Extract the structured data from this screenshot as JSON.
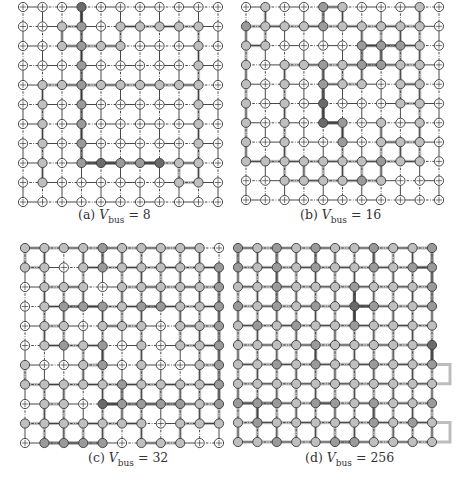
{
  "figure": {
    "grid_size": 11,
    "legend": {
      "0": "empty node (white, crossed)",
      "1": "light gray node",
      "2": "medium gray node",
      "3": "dark node"
    },
    "colors": {
      "edge_thin": "#333333",
      "edge_light": "#bdbdbd",
      "edge_mid": "#8a8a8a",
      "edge_dark": "#5a5a5a",
      "node_empty": "#ffffff",
      "node_light": "#bfbfbf",
      "node_mid": "#9a9a9a",
      "node_dark": "#6a6a6a",
      "node_stroke": "#3a3a3a"
    },
    "panels": [
      {
        "id": "a",
        "label": "(a)",
        "var": "V",
        "sub": "bus",
        "value": "= 8",
        "origin": [
          23,
          7
        ],
        "spacing": [
          19.5,
          19.5
        ],
        "caption_pos": [
          78,
          207
        ],
        "nodes": [
          [
            0,
            0,
            0,
            3,
            0,
            0,
            0,
            0,
            0,
            0,
            0
          ],
          [
            0,
            0,
            1,
            2,
            0,
            1,
            1,
            1,
            1,
            1,
            0
          ],
          [
            0,
            0,
            1,
            2,
            1,
            1,
            0,
            0,
            0,
            1,
            0
          ],
          [
            0,
            0,
            0,
            2,
            0,
            0,
            0,
            0,
            0,
            1,
            0
          ],
          [
            0,
            1,
            1,
            2,
            1,
            1,
            1,
            1,
            1,
            1,
            0
          ],
          [
            0,
            1,
            0,
            2,
            0,
            0,
            0,
            0,
            0,
            1,
            0
          ],
          [
            0,
            1,
            0,
            2,
            0,
            0,
            0,
            0,
            0,
            1,
            0
          ],
          [
            0,
            1,
            0,
            2,
            0,
            0,
            0,
            0,
            0,
            1,
            0
          ],
          [
            0,
            1,
            0,
            2,
            3,
            2,
            2,
            3,
            1,
            1,
            0
          ],
          [
            0,
            1,
            0,
            0,
            0,
            0,
            0,
            0,
            1,
            1,
            0
          ],
          [
            0,
            0,
            0,
            0,
            0,
            0,
            0,
            0,
            0,
            0,
            0
          ]
        ],
        "extensions": []
      },
      {
        "id": "b",
        "label": "(b)",
        "var": "V",
        "sub": "bus",
        "value": "= 16",
        "origin": [
          246,
          7
        ],
        "spacing": [
          19.3,
          19.3
        ],
        "caption_pos": [
          300,
          207
        ],
        "nodes": [
          [
            0,
            1,
            0,
            0,
            2,
            1,
            0,
            0,
            0,
            1,
            0
          ],
          [
            2,
            1,
            1,
            1,
            2,
            1,
            1,
            1,
            1,
            1,
            0
          ],
          [
            1,
            1,
            0,
            0,
            0,
            0,
            2,
            2,
            2,
            1,
            0
          ],
          [
            1,
            0,
            1,
            1,
            2,
            1,
            2,
            2,
            1,
            1,
            0
          ],
          [
            1,
            0,
            1,
            0,
            2,
            1,
            1,
            0,
            1,
            1,
            0
          ],
          [
            1,
            0,
            1,
            0,
            3,
            0,
            0,
            0,
            1,
            1,
            0
          ],
          [
            1,
            0,
            1,
            0,
            3,
            2,
            0,
            1,
            0,
            1,
            0
          ],
          [
            1,
            0,
            1,
            0,
            0,
            2,
            0,
            1,
            1,
            1,
            0
          ],
          [
            1,
            1,
            1,
            1,
            1,
            1,
            1,
            2,
            1,
            1,
            0
          ],
          [
            0,
            0,
            1,
            1,
            1,
            1,
            2,
            1,
            0,
            0,
            0
          ],
          [
            0,
            0,
            0,
            0,
            0,
            0,
            0,
            0,
            0,
            0,
            0
          ]
        ],
        "extensions": []
      },
      {
        "id": "c",
        "label": "(c)",
        "var": "V",
        "sub": "bus",
        "value": "= 32",
        "origin": [
          25,
          248
        ],
        "spacing": [
          19.4,
          19.5
        ],
        "caption_pos": [
          88,
          450
        ],
        "nodes": [
          [
            1,
            1,
            1,
            1,
            2,
            1,
            1,
            1,
            1,
            1,
            0
          ],
          [
            1,
            1,
            0,
            1,
            2,
            1,
            1,
            1,
            1,
            1,
            2
          ],
          [
            0,
            1,
            1,
            1,
            0,
            1,
            1,
            1,
            1,
            1,
            2
          ],
          [
            0,
            1,
            2,
            2,
            2,
            1,
            2,
            2,
            1,
            1,
            2
          ],
          [
            0,
            1,
            1,
            0,
            1,
            1,
            1,
            0,
            1,
            1,
            2
          ],
          [
            0,
            1,
            2,
            1,
            2,
            0,
            1,
            0,
            1,
            1,
            2
          ],
          [
            1,
            0,
            0,
            1,
            2,
            0,
            1,
            0,
            0,
            1,
            2
          ],
          [
            1,
            1,
            1,
            1,
            1,
            2,
            1,
            1,
            1,
            1,
            2
          ],
          [
            0,
            1,
            1,
            0,
            3,
            2,
            2,
            2,
            2,
            1,
            2
          ],
          [
            1,
            1,
            1,
            1,
            1,
            1,
            1,
            0,
            1,
            1,
            1
          ],
          [
            0,
            2,
            2,
            2,
            2,
            0,
            1,
            1,
            1,
            0,
            0
          ]
        ],
        "extensions": []
      },
      {
        "id": "d",
        "label": "(d)",
        "var": "V",
        "sub": "bus",
        "value": "= 256",
        "origin": [
          238,
          248
        ],
        "spacing": [
          19.4,
          19.4
        ],
        "caption_pos": [
          305,
          450
        ],
        "nodes": [
          [
            2,
            1,
            2,
            1,
            2,
            1,
            1,
            2,
            1,
            1,
            2
          ],
          [
            2,
            1,
            2,
            1,
            2,
            1,
            1,
            2,
            1,
            2,
            2
          ],
          [
            1,
            1,
            2,
            1,
            1,
            1,
            2,
            1,
            1,
            1,
            2
          ],
          [
            2,
            1,
            2,
            1,
            2,
            1,
            3,
            2,
            1,
            1,
            2
          ],
          [
            1,
            2,
            1,
            2,
            1,
            1,
            2,
            1,
            1,
            1,
            1
          ],
          [
            1,
            1,
            1,
            1,
            2,
            1,
            1,
            1,
            1,
            1,
            3
          ],
          [
            1,
            1,
            2,
            1,
            2,
            1,
            1,
            2,
            1,
            1,
            2
          ],
          [
            1,
            1,
            1,
            1,
            1,
            1,
            1,
            1,
            1,
            1,
            1
          ],
          [
            2,
            2,
            2,
            1,
            2,
            2,
            1,
            2,
            1,
            1,
            2
          ],
          [
            1,
            2,
            1,
            1,
            1,
            1,
            1,
            2,
            1,
            2,
            1
          ],
          [
            1,
            1,
            2,
            1,
            1,
            2,
            2,
            1,
            1,
            1,
            1
          ]
        ],
        "extensions": [
          {
            "row_from": 6,
            "row_to": 7,
            "x_end": 450
          },
          {
            "row_from": 9,
            "row_to": 10,
            "x_end": 450
          }
        ]
      }
    ]
  }
}
